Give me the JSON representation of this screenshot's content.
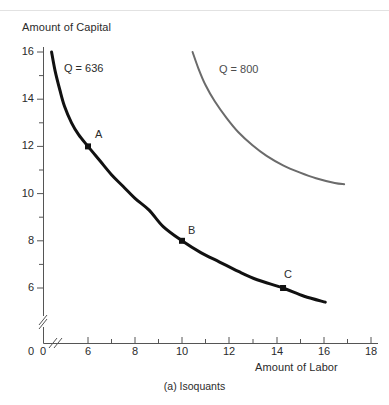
{
  "chart_data": {
    "type": "line",
    "title": "",
    "caption": "(a) Isoquants",
    "xlabel": "Amount of Labor",
    "ylabel": "Amount of Capital",
    "xlim": [
      0,
      18
    ],
    "ylim": [
      0,
      16
    ],
    "axis_break_x": true,
    "axis_break_y": true,
    "grid": false,
    "legend_position": "inline-labels",
    "x_ticks_major": [
      0,
      6,
      8,
      10,
      12,
      14,
      16,
      18
    ],
    "x_tick_labels": [
      "0",
      "6",
      "8",
      "10",
      "12",
      "14",
      "16",
      "18"
    ],
    "x_ticks_minor": [
      7,
      9,
      11,
      13,
      15,
      17
    ],
    "y_ticks_major": [
      6,
      8,
      10,
      12,
      14,
      16
    ],
    "y_tick_labels": [
      "0",
      "6",
      "8",
      "10",
      "12",
      "14",
      "16"
    ],
    "y_ticks_minor": [
      7,
      9,
      11,
      13,
      15
    ],
    "y_zero_label": "0",
    "series": [
      {
        "name": "Q = 636",
        "label": "Q = 636",
        "color": "#111111",
        "width": 3,
        "points": [
          [
            4.45,
            16.0
          ],
          [
            4.6,
            15.2
          ],
          [
            4.8,
            14.4
          ],
          [
            5.0,
            13.7
          ],
          [
            5.3,
            13.0
          ],
          [
            5.6,
            12.5
          ],
          [
            6.0,
            12.0
          ],
          [
            6.5,
            11.4
          ],
          [
            7.0,
            10.8
          ],
          [
            7.5,
            10.3
          ],
          [
            8.0,
            9.8
          ],
          [
            8.6,
            9.3
          ],
          [
            9.2,
            8.6
          ],
          [
            10.0,
            8.0
          ],
          [
            10.8,
            7.5
          ],
          [
            11.6,
            7.1
          ],
          [
            12.4,
            6.7
          ],
          [
            13.2,
            6.35
          ],
          [
            14.3,
            6.0
          ],
          [
            15.2,
            5.65
          ],
          [
            16.1,
            5.4
          ]
        ]
      },
      {
        "name": "Q = 800",
        "label": "Q = 800",
        "color": "#6b6b6b",
        "width": 2,
        "points": [
          [
            10.45,
            16.0
          ],
          [
            10.7,
            15.3
          ],
          [
            11.0,
            14.6
          ],
          [
            11.4,
            13.9
          ],
          [
            11.9,
            13.2
          ],
          [
            12.4,
            12.6
          ],
          [
            13.0,
            12.05
          ],
          [
            13.6,
            11.6
          ],
          [
            14.3,
            11.2
          ],
          [
            15.0,
            10.9
          ],
          [
            15.7,
            10.65
          ],
          [
            16.5,
            10.45
          ],
          [
            16.9,
            10.4
          ]
        ]
      }
    ],
    "annotated_points": [
      {
        "label": "A",
        "x": 6.0,
        "y": 12.0,
        "marker": "square",
        "color": "#111111"
      },
      {
        "label": "B",
        "x": 10.0,
        "y": 8.0,
        "marker": "square",
        "color": "#111111"
      },
      {
        "label": "C",
        "x": 14.3,
        "y": 6.0,
        "marker": "square",
        "color": "#111111"
      }
    ]
  },
  "labels": {
    "y_axis_title": "Amount of Capital",
    "x_axis_title": "Amount of Labor",
    "caption": "(a) Isoquants",
    "curve1": "Q = 636",
    "curve2": "Q = 800",
    "point_a": "A",
    "point_b": "B",
    "point_c": "C",
    "x0": "0",
    "x6": "6",
    "x8": "8",
    "x10": "10",
    "x12": "12",
    "x14": "14",
    "x16": "16",
    "x18": "18",
    "y0": "0",
    "y6": "6",
    "y8": "8",
    "y10": "10",
    "y12": "12",
    "y14": "14",
    "y16": "16"
  }
}
